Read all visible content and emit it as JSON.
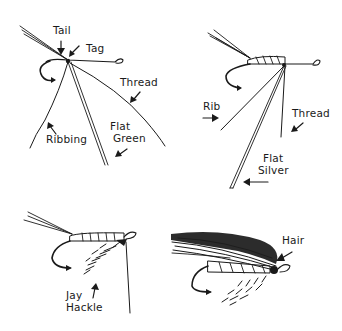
{
  "diagram": {
    "type": "fly-tying-steps",
    "colors": {
      "ink": "#1a1a1a",
      "background": "#ffffff"
    },
    "panels": [
      {
        "id": "step-1",
        "labels": {
          "tail": "Tail",
          "tag": "Tag",
          "thread": "Thread",
          "ribbing": "Ribbing",
          "flat_green_1": "Flat",
          "flat_green_2": "Green"
        }
      },
      {
        "id": "step-2",
        "labels": {
          "rib": "Rib",
          "thread": "Thread",
          "flat_silver_1": "Flat",
          "flat_silver_2": "Silver"
        }
      },
      {
        "id": "step-3",
        "labels": {
          "jay_hackle_1": "Jay",
          "jay_hackle_2": "Hackle"
        }
      },
      {
        "id": "step-4",
        "labels": {
          "hair": "Hair"
        }
      }
    ]
  }
}
